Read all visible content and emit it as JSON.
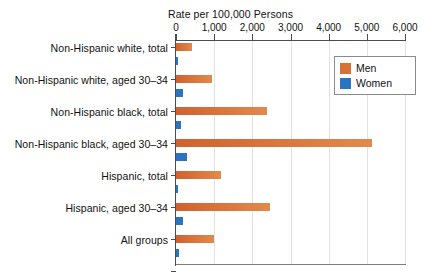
{
  "chart_data": {
    "type": "bar",
    "orientation": "horizontal",
    "title": "",
    "xlabel": "Rate per 100,000 Persons",
    "ylabel": "",
    "xlim": [
      0,
      6000
    ],
    "grid": true,
    "legend_position": "top-right",
    "xticks": [
      {
        "value": 0,
        "label": "0"
      },
      {
        "value": 1000,
        "label": "1,000"
      },
      {
        "value": 2000,
        "label": "2,000"
      },
      {
        "value": 3000,
        "label": "3,000"
      },
      {
        "value": 4000,
        "label": "4,000"
      },
      {
        "value": 5000,
        "label": "5,000"
      },
      {
        "value": 6000,
        "label": "6,000"
      }
    ],
    "categories": [
      "Non-Hispanic white, total",
      "Non-Hispanic white, aged 30–34",
      "Non-Hispanic black, total",
      "Non-Hispanic black, aged 30–34",
      "Hispanic, total",
      "Hispanic, aged 30–34",
      "All groups"
    ],
    "series": [
      {
        "name": "Men",
        "color": "#d9703a",
        "values": [
          430,
          950,
          2380,
          5130,
          1180,
          2460,
          1000
        ]
      },
      {
        "name": "Women",
        "color": "#2b74c4",
        "values": [
          60,
          190,
          130,
          300,
          55,
          190,
          75
        ]
      }
    ]
  },
  "legend": {
    "items": [
      {
        "label": "Men",
        "swatch": "men-color-swatch"
      },
      {
        "label": "Women",
        "swatch": "women-color-swatch"
      }
    ]
  }
}
